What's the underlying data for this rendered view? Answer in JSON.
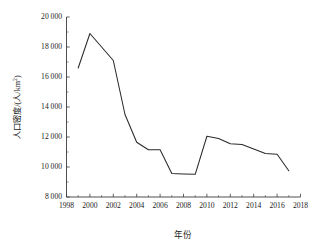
{
  "chart_data": {
    "type": "line",
    "title": "",
    "xlabel": "年份",
    "ylabel": "人口密度/(人/km²)",
    "ylabel_parts": {
      "name": "人口密度",
      "separator": "/(",
      "unit_numerator": "人",
      "unit_slash": "/",
      "unit_denominator": "km",
      "unit_exponent": "2",
      "closing": ")"
    },
    "x": [
      1999,
      2000,
      2001,
      2002,
      2003,
      2004,
      2005,
      2006,
      2007,
      2008,
      2009,
      2010,
      2011,
      2012,
      2013,
      2014,
      2015,
      2016,
      2017
    ],
    "values": [
      16600,
      18900,
      18000,
      17100,
      13500,
      11650,
      11150,
      11150,
      9570,
      9540,
      9510,
      12050,
      11900,
      11550,
      11500,
      11200,
      10900,
      10850,
      9750
    ],
    "series": [
      {
        "name": "人口密度",
        "values": [
          16600,
          18900,
          18000,
          17100,
          13500,
          11650,
          11150,
          11150,
          9570,
          9540,
          9510,
          12050,
          11900,
          11550,
          11500,
          11200,
          10900,
          10850,
          9750
        ]
      }
    ],
    "xlim": [
      1998,
      2018
    ],
    "ylim": [
      8000,
      20000
    ],
    "xticks": [
      1998,
      2000,
      2002,
      2004,
      2006,
      2008,
      2010,
      2012,
      2014,
      2016,
      2018
    ],
    "xtick_labels": [
      "1998",
      "2000",
      "2002",
      "2004",
      "2006",
      "2008",
      "2010",
      "2012",
      "2014",
      "2016",
      "2018"
    ],
    "yticks": [
      8000,
      10000,
      12000,
      14000,
      16000,
      18000,
      20000
    ],
    "ytick_labels": [
      "8 000",
      "10 000",
      "12 000",
      "14 000",
      "16 000",
      "18 000",
      "20 000"
    ],
    "grid": false,
    "legend": "none",
    "line_color": "#2a2a2a",
    "axis_color": "#3b3b3b",
    "background_color": "#ffffff"
  }
}
